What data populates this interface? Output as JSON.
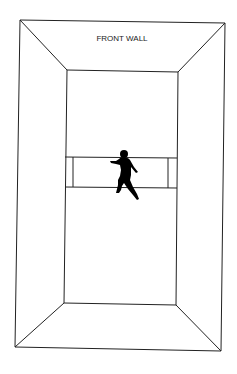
{
  "diagram": {
    "type": "court-perspective",
    "labels": {
      "front_wall": "FRONT WALL"
    },
    "stroke_color": "#222222",
    "figure_color": "#000000",
    "background": "#ffffff"
  }
}
